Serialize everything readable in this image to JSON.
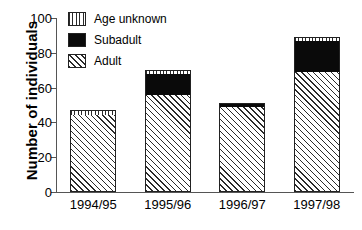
{
  "chart_data": {
    "type": "bar",
    "title": "",
    "subtitle": "",
    "xlabel": "",
    "ylabel": "Number of individuals",
    "categories": [
      "1994/95",
      "1995/96",
      "1996/97",
      "1997/98"
    ],
    "ylim": [
      0,
      100
    ],
    "yticks": [
      0,
      20,
      40,
      60,
      80,
      100
    ],
    "ytick_labels": [
      "0",
      "20",
      "40",
      "60",
      "80",
      "100"
    ],
    "grid": false,
    "stacked": true,
    "legend_position": "top-left",
    "series": [
      {
        "name": "Adult",
        "pattern": "diagonal-hatch",
        "values": [
          44,
          56,
          49,
          69
        ]
      },
      {
        "name": "Subadult",
        "pattern": "solid-black",
        "values": [
          0,
          12,
          2,
          18
        ]
      },
      {
        "name": "Age unknown",
        "pattern": "vertical-lines",
        "values": [
          3,
          2,
          0,
          2
        ]
      }
    ],
    "totals": [
      47,
      70,
      51,
      89
    ],
    "annotations": []
  },
  "legend": {
    "items": [
      {
        "label": "Age unknown",
        "swatch": "vertical-lines-swatch"
      },
      {
        "label": "Subadult",
        "swatch": "solid-black-swatch"
      },
      {
        "label": "Adult",
        "swatch": "diagonal-hatch-swatch"
      }
    ]
  },
  "colors": {
    "ink": "#000000",
    "axis": "#555555",
    "subadult_fill": "#0a0a0a",
    "background": "#ffffff"
  }
}
